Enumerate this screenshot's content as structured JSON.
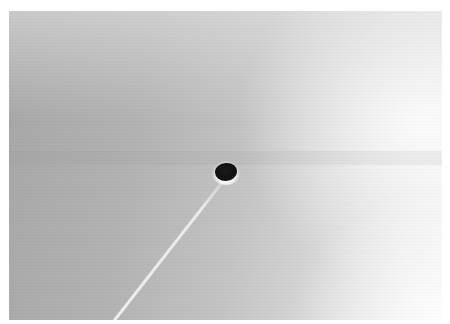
{
  "image": {
    "kind": "grayscale micrograph",
    "colors": {
      "border": "#ffffff",
      "left_tone": "#a6a6a6",
      "right_tone": "#f2f2f2",
      "spot": "#111111",
      "streak": "#f5f5f5"
    },
    "features": [
      {
        "name": "dark-spot",
        "center": [
          227,
          172
        ]
      },
      {
        "name": "diagonal-streak",
        "from": [
          245,
          315
        ],
        "to": [
          430,
          75
        ]
      }
    ]
  }
}
